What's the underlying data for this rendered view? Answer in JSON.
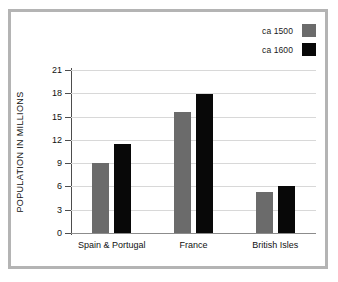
{
  "chart_data": {
    "type": "bar",
    "title": "",
    "xlabel": "",
    "ylabel": "POPULATION IN MILLIONS",
    "categories": [
      "Spain & Portugal",
      "France",
      "British Isles"
    ],
    "series": [
      {
        "name": "ca 1500",
        "color": "#6b6b6b",
        "values": [
          9.0,
          15.6,
          5.3
        ]
      },
      {
        "name": "ca 1600",
        "color": "#080808",
        "values": [
          11.5,
          17.9,
          6.1
        ]
      }
    ],
    "ylim": [
      0,
      21
    ],
    "yticks": [
      0,
      3,
      6,
      9,
      12,
      15,
      18,
      21
    ],
    "ytick_labels": [
      "0",
      "3",
      "6",
      "9",
      "12",
      "15",
      "18",
      "21"
    ],
    "grid": true,
    "legend_position": "top-right"
  },
  "legend": {
    "entries": [
      {
        "label": "ca 1500",
        "swatch": "#6b6b6b"
      },
      {
        "label": "ca 1600",
        "swatch": "#080808"
      }
    ]
  }
}
